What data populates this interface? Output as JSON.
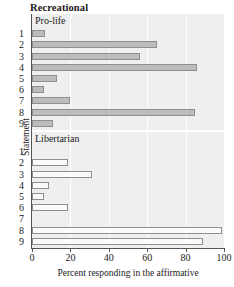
{
  "chart_data": {
    "type": "bar",
    "orientation": "horizontal",
    "title": "Recreational",
    "xlabel": "Percent responding in the affirmative",
    "ylabel": "Statement",
    "xlim": [
      0,
      100
    ],
    "xticks": [
      0,
      20,
      40,
      60,
      80,
      100
    ],
    "xticklabels": [
      "0",
      "20",
      "40",
      "60",
      "80",
      "100"
    ],
    "categories": [
      "1",
      "2",
      "3",
      "4",
      "5",
      "6",
      "7",
      "8",
      "9"
    ],
    "grid": "vertical-white",
    "legend": "none",
    "panels": [
      {
        "label": "Pro-life",
        "fill": "#bdbdbd",
        "values": [
          7,
          65,
          56,
          86,
          13,
          6,
          20,
          85,
          11
        ]
      },
      {
        "label": "Libertarian",
        "fill": "#fbfbfb",
        "values": [
          0,
          19,
          31,
          9,
          6,
          19,
          0,
          99,
          89
        ]
      }
    ]
  },
  "colors": {
    "panel_background": "#efefef",
    "gridline": "#ffffff",
    "bar_edge": "#8e8e8e",
    "bar_fill_prolife": "#bdbdbd",
    "bar_fill_libertarian": "#fbfbfb",
    "axis": "#555555",
    "text": "#1a1a1a"
  }
}
